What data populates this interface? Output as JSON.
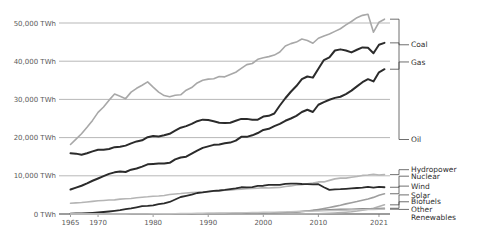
{
  "chart_data": {
    "type": "line",
    "title": "",
    "xlabel": "",
    "ylabel": "",
    "xlim": [
      1964,
      2023
    ],
    "ylim": [
      0,
      55000
    ],
    "grid": true,
    "legend_position": "right-inline",
    "unit": "TWh",
    "y_ticks": [
      {
        "value": 0,
        "label": "0 TWh"
      },
      {
        "value": 10000,
        "label": "10,000 TWh"
      },
      {
        "value": 20000,
        "label": "20,000 TWh"
      },
      {
        "value": 30000,
        "label": "30,000 TWh"
      },
      {
        "value": 40000,
        "label": "40,000 TWh"
      },
      {
        "value": 50000,
        "label": "50,000 TWh"
      }
    ],
    "x_ticks": [
      {
        "value": 1965,
        "label": "1965"
      },
      {
        "value": 1970,
        "label": "1970"
      },
      {
        "value": 1980,
        "label": "1980"
      },
      {
        "value": 1990,
        "label": "1990"
      },
      {
        "value": 2000,
        "label": "2000"
      },
      {
        "value": 2010,
        "label": "2010"
      },
      {
        "value": 2021,
        "label": "2021"
      }
    ],
    "x": [
      1965,
      1966,
      1967,
      1968,
      1969,
      1970,
      1971,
      1972,
      1973,
      1974,
      1975,
      1976,
      1977,
      1978,
      1979,
      1980,
      1981,
      1982,
      1983,
      1984,
      1985,
      1986,
      1987,
      1988,
      1989,
      1990,
      1991,
      1992,
      1993,
      1994,
      1995,
      1996,
      1997,
      1998,
      1999,
      2000,
      2001,
      2002,
      2003,
      2004,
      2005,
      2006,
      2007,
      2008,
      2009,
      2010,
      2011,
      2012,
      2013,
      2014,
      2015,
      2016,
      2017,
      2018,
      2019,
      2020,
      2021,
      2022
    ],
    "series": [
      {
        "name": "Oil",
        "label": "Oil",
        "color": "#a8a8a8",
        "width": 1.6,
        "label_y": 19500,
        "values": [
          18200,
          19600,
          21000,
          22700,
          24500,
          26600,
          28000,
          29800,
          31400,
          30800,
          30200,
          31900,
          32900,
          33700,
          34600,
          33200,
          31900,
          31000,
          30700,
          31100,
          31200,
          32400,
          33100,
          34300,
          35000,
          35300,
          35400,
          36000,
          35900,
          36500,
          37100,
          38100,
          39100,
          39400,
          40500,
          40900,
          41200,
          41600,
          42400,
          44000,
          44600,
          45000,
          45800,
          45400,
          44700,
          46000,
          46600,
          47100,
          47800,
          48500,
          49500,
          50400,
          51400,
          52000,
          52300,
          47600,
          50200,
          51000
        ]
      },
      {
        "name": "Coal",
        "label": "Coal",
        "color": "#2b2b2b",
        "width": 2.0,
        "label_y": 44300,
        "values": [
          15900,
          15800,
          15500,
          15900,
          16400,
          16800,
          16800,
          17000,
          17500,
          17600,
          17900,
          18500,
          19000,
          19300,
          20100,
          20400,
          20300,
          20600,
          21000,
          21800,
          22600,
          23000,
          23600,
          24300,
          24700,
          24600,
          24300,
          23900,
          23800,
          23900,
          24400,
          24900,
          24900,
          24700,
          24700,
          25500,
          25700,
          26300,
          28400,
          30300,
          32000,
          33500,
          35300,
          36000,
          35700,
          38000,
          40300,
          41000,
          42800,
          43100,
          42800,
          42300,
          43000,
          43600,
          43500,
          42100,
          44300,
          44800
        ]
      },
      {
        "name": "Gas",
        "label": "Gas",
        "color": "#2b2b2b",
        "width": 2.0,
        "label_y": 39800,
        "values": [
          6400,
          6900,
          7400,
          8000,
          8700,
          9300,
          9900,
          10500,
          10900,
          11100,
          11000,
          11600,
          11900,
          12400,
          13000,
          13100,
          13200,
          13200,
          13400,
          14300,
          14800,
          15000,
          15800,
          16600,
          17300,
          17700,
          18100,
          18200,
          18500,
          18700,
          19200,
          20200,
          20200,
          20600,
          21200,
          22000,
          22300,
          23000,
          23600,
          24400,
          25000,
          25700,
          26700,
          27300,
          26700,
          28600,
          29300,
          29900,
          30400,
          30700,
          31400,
          32300,
          33400,
          34500,
          35300,
          34700,
          37100,
          37900
        ]
      },
      {
        "name": "Hydropower",
        "label": "Hydropower",
        "color": "#b5b5b5",
        "width": 1.6,
        "label_y": 11600,
        "values": [
          2800,
          2900,
          3000,
          3150,
          3300,
          3450,
          3550,
          3650,
          3700,
          3900,
          4000,
          4050,
          4250,
          4400,
          4500,
          4650,
          4700,
          4850,
          5100,
          5250,
          5350,
          5500,
          5600,
          5700,
          5750,
          5900,
          6000,
          6000,
          6200,
          6250,
          6400,
          6500,
          6600,
          6700,
          6750,
          6900,
          6800,
          6900,
          6950,
          7200,
          7350,
          7600,
          7700,
          7900,
          8100,
          8400,
          8400,
          8800,
          9200,
          9400,
          9400,
          9600,
          9800,
          10100,
          10200,
          10400,
          10200,
          10300
        ]
      },
      {
        "name": "Nuclear",
        "label": "Nuclear",
        "color": "#2b2b2b",
        "width": 1.8,
        "label_y": 9900,
        "values": [
          100,
          130,
          170,
          230,
          300,
          400,
          520,
          660,
          820,
          1000,
          1250,
          1480,
          1750,
          2050,
          2120,
          2250,
          2600,
          2800,
          3150,
          3800,
          4450,
          4750,
          5050,
          5500,
          5650,
          5850,
          6050,
          6150,
          6300,
          6500,
          6700,
          7000,
          6950,
          7050,
          7350,
          7400,
          7600,
          7650,
          7600,
          7900,
          7950,
          7950,
          7850,
          7800,
          7750,
          7800,
          7000,
          6300,
          6450,
          6500,
          6600,
          6700,
          6800,
          6900,
          7100,
          6900,
          7100,
          7000
        ]
      },
      {
        "name": "Wind",
        "label": "Wind",
        "color": "#9e9e9e",
        "width": 1.6,
        "label_y": 7300,
        "values": [
          0,
          0,
          0,
          0,
          0,
          0,
          0,
          0,
          0,
          0,
          0,
          0,
          0,
          0,
          0,
          0,
          0,
          0,
          5,
          8,
          10,
          12,
          15,
          18,
          22,
          26,
          30,
          35,
          42,
          50,
          60,
          70,
          85,
          100,
          120,
          160,
          190,
          230,
          280,
          340,
          420,
          500,
          620,
          770,
          950,
          1180,
          1430,
          1700,
          2000,
          2300,
          2650,
          2950,
          3250,
          3600,
          3950,
          4350,
          4900,
          5300
        ]
      },
      {
        "name": "Solar",
        "label": "Solar",
        "color": "#b0b0b0",
        "width": 1.6,
        "label_y": 5000,
        "values": [
          0,
          0,
          0,
          0,
          0,
          0,
          0,
          0,
          0,
          0,
          0,
          0,
          0,
          0,
          0,
          0,
          0,
          0,
          0,
          0,
          0,
          0,
          0,
          0,
          0,
          1,
          1,
          1,
          2,
          2,
          3,
          3,
          4,
          5,
          6,
          7,
          8,
          10,
          12,
          15,
          20,
          26,
          35,
          48,
          62,
          85,
          130,
          190,
          270,
          360,
          470,
          600,
          780,
          1000,
          1250,
          1500,
          1950,
          2400
        ]
      },
      {
        "name": "Biofuels",
        "label": "Biofuels",
        "color": "#8c8c8c",
        "width": 1.4,
        "label_y": 3200,
        "values": [
          0,
          0,
          0,
          0,
          0,
          0,
          0,
          0,
          0,
          0,
          0,
          0,
          0,
          0,
          0,
          5,
          10,
          20,
          35,
          50,
          65,
          75,
          85,
          95,
          110,
          120,
          130,
          140,
          150,
          165,
          180,
          195,
          210,
          230,
          250,
          270,
          290,
          320,
          360,
          420,
          500,
          580,
          700,
          830,
          900,
          1000,
          1080,
          1120,
          1180,
          1230,
          1260,
          1280,
          1320,
          1380,
          1420,
          1340,
          1450,
          1500
        ]
      },
      {
        "name": "Other Renewables",
        "label": "Other",
        "label2": "Renewables",
        "color": "#c2c2c2",
        "width": 1.4,
        "label_y": 1200,
        "values": [
          0,
          0,
          0,
          0,
          0,
          0,
          0,
          0,
          5,
          10,
          15,
          20,
          25,
          30,
          40,
          50,
          60,
          70,
          85,
          100,
          120,
          140,
          160,
          180,
          200,
          220,
          240,
          260,
          280,
          300,
          320,
          340,
          365,
          390,
          410,
          440,
          470,
          500,
          530,
          565,
          600,
          640,
          680,
          720,
          760,
          800,
          840,
          880,
          920,
          960,
          1000,
          1040,
          1080,
          1120,
          1160,
          1180,
          1220,
          1260
        ]
      }
    ],
    "legend_entries": [
      {
        "label": "Oil"
      },
      {
        "label": "Coal"
      },
      {
        "label": "Gas"
      },
      {
        "label": "Hydropower"
      },
      {
        "label": "Nuclear"
      },
      {
        "label": "Wind"
      },
      {
        "label": "Solar"
      },
      {
        "label": "Biofuels"
      },
      {
        "label": "Other"
      },
      {
        "label": "Renewables"
      }
    ]
  }
}
